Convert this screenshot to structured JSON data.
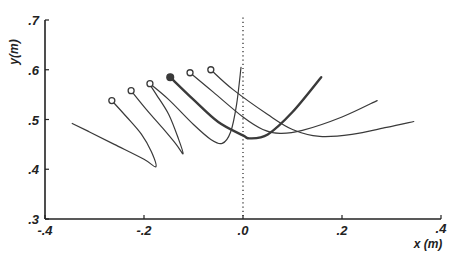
{
  "chart_data": {
    "type": "line",
    "title": "",
    "xlabel": "x (m)",
    "ylabel": "y(m)",
    "xlim": [
      -0.4,
      0.4
    ],
    "ylim": [
      0.3,
      0.7
    ],
    "x_ticks": [
      -0.4,
      -0.2,
      0.0,
      0.2,
      0.4
    ],
    "x_tick_labels": [
      "-.4",
      "-.2",
      ".0",
      ".2",
      ".4"
    ],
    "y_ticks": [
      0.3,
      0.4,
      0.5,
      0.6,
      0.7
    ],
    "y_tick_labels": [
      ".3",
      ".4",
      ".5",
      ".6",
      ".7"
    ],
    "grid": false,
    "legend": null,
    "reference_line": {
      "orientation": "vertical",
      "x": 0.0,
      "style": "dotted",
      "y_range": [
        0.3,
        0.705
      ]
    },
    "series": [
      {
        "name": "trajectory-1",
        "start_marker": "open-circle",
        "emphasis": false,
        "points": [
          [
            -0.265,
            0.538
          ],
          [
            -0.235,
            0.505
          ],
          [
            -0.205,
            0.47
          ],
          [
            -0.185,
            0.435
          ],
          [
            -0.176,
            0.405
          ],
          [
            -0.2,
            0.42
          ],
          [
            -0.26,
            0.45
          ],
          [
            -0.31,
            0.475
          ],
          [
            -0.345,
            0.492
          ]
        ]
      },
      {
        "name": "trajectory-2",
        "start_marker": "open-circle",
        "emphasis": false,
        "points": [
          [
            -0.226,
            0.558
          ],
          [
            -0.195,
            0.52
          ],
          [
            -0.16,
            0.48
          ],
          [
            -0.135,
            0.45
          ],
          [
            -0.121,
            0.431
          ],
          [
            -0.13,
            0.46
          ],
          [
            -0.15,
            0.51
          ],
          [
            -0.175,
            0.55
          ],
          [
            -0.188,
            0.57
          ]
        ]
      },
      {
        "name": "trajectory-3",
        "start_marker": "open-circle",
        "emphasis": false,
        "points": [
          [
            -0.188,
            0.572
          ],
          [
            -0.15,
            0.54
          ],
          [
            -0.1,
            0.49
          ],
          [
            -0.065,
            0.46
          ],
          [
            -0.042,
            0.452
          ],
          [
            -0.025,
            0.475
          ],
          [
            -0.013,
            0.53
          ],
          [
            -0.004,
            0.605
          ]
        ]
      },
      {
        "name": "trajectory-4",
        "start_marker": "filled-circle",
        "emphasis": true,
        "points": [
          [
            -0.147,
            0.585
          ],
          [
            -0.1,
            0.54
          ],
          [
            -0.05,
            0.495
          ],
          [
            0.0,
            0.468
          ],
          [
            0.014,
            0.462
          ],
          [
            0.05,
            0.47
          ],
          [
            0.1,
            0.515
          ],
          [
            0.158,
            0.585
          ]
        ]
      },
      {
        "name": "trajectory-5",
        "start_marker": "open-circle",
        "emphasis": false,
        "points": [
          [
            -0.107,
            0.594
          ],
          [
            -0.06,
            0.555
          ],
          [
            0.0,
            0.505
          ],
          [
            0.04,
            0.48
          ],
          [
            0.075,
            0.472
          ],
          [
            0.12,
            0.478
          ],
          [
            0.2,
            0.505
          ],
          [
            0.271,
            0.538
          ]
        ]
      },
      {
        "name": "trajectory-6",
        "start_marker": "open-circle",
        "emphasis": false,
        "points": [
          [
            -0.065,
            0.6
          ],
          [
            -0.02,
            0.56
          ],
          [
            0.05,
            0.51
          ],
          [
            0.1,
            0.48
          ],
          [
            0.155,
            0.466
          ],
          [
            0.22,
            0.47
          ],
          [
            0.29,
            0.484
          ],
          [
            0.345,
            0.496
          ]
        ]
      }
    ]
  },
  "colors": {
    "line": "#3a3a3a",
    "axis": "#222222",
    "background": "#ffffff"
  }
}
